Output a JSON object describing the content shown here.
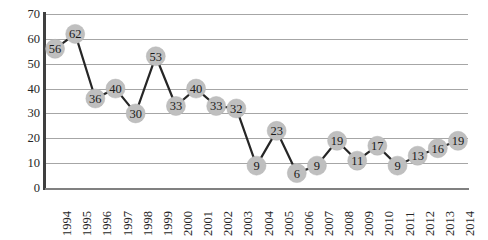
{
  "chart_data": {
    "type": "line",
    "title": "",
    "xlabel": "",
    "ylabel": "",
    "ylim": [
      0,
      70
    ],
    "ytick_step": 10,
    "yticks": [
      70,
      60,
      50,
      40,
      30,
      20,
      10,
      0
    ],
    "grid": true,
    "legend": "none",
    "marker_labels": true,
    "categories": [
      "1994",
      "1995",
      "1996",
      "1997",
      "1998",
      "1999",
      "2000",
      "2001",
      "2002",
      "2003",
      "2004",
      "2005",
      "2006",
      "2007",
      "2008",
      "2009",
      "2010",
      "2011",
      "2012",
      "2013",
      "2014"
    ],
    "values": [
      56,
      62,
      36,
      40,
      30,
      53,
      33,
      40,
      33,
      32,
      9,
      23,
      6,
      9,
      19,
      11,
      17,
      9,
      13,
      16,
      19
    ],
    "series": [
      {
        "name": "series-1",
        "values": [
          56,
          62,
          36,
          40,
          30,
          53,
          33,
          40,
          33,
          32,
          9,
          23,
          6,
          9,
          19,
          11,
          17,
          9,
          13,
          16,
          19
        ]
      }
    ]
  },
  "colors": {
    "line": "#262626",
    "marker_fill": "#bfbfbf",
    "marker_text": "#1a1a1a",
    "gridline": "#a6a6a6",
    "axis_y": "#3f3f3f",
    "axis_x": "#808080",
    "background": "#ffffff",
    "tick_text": "#262626"
  }
}
